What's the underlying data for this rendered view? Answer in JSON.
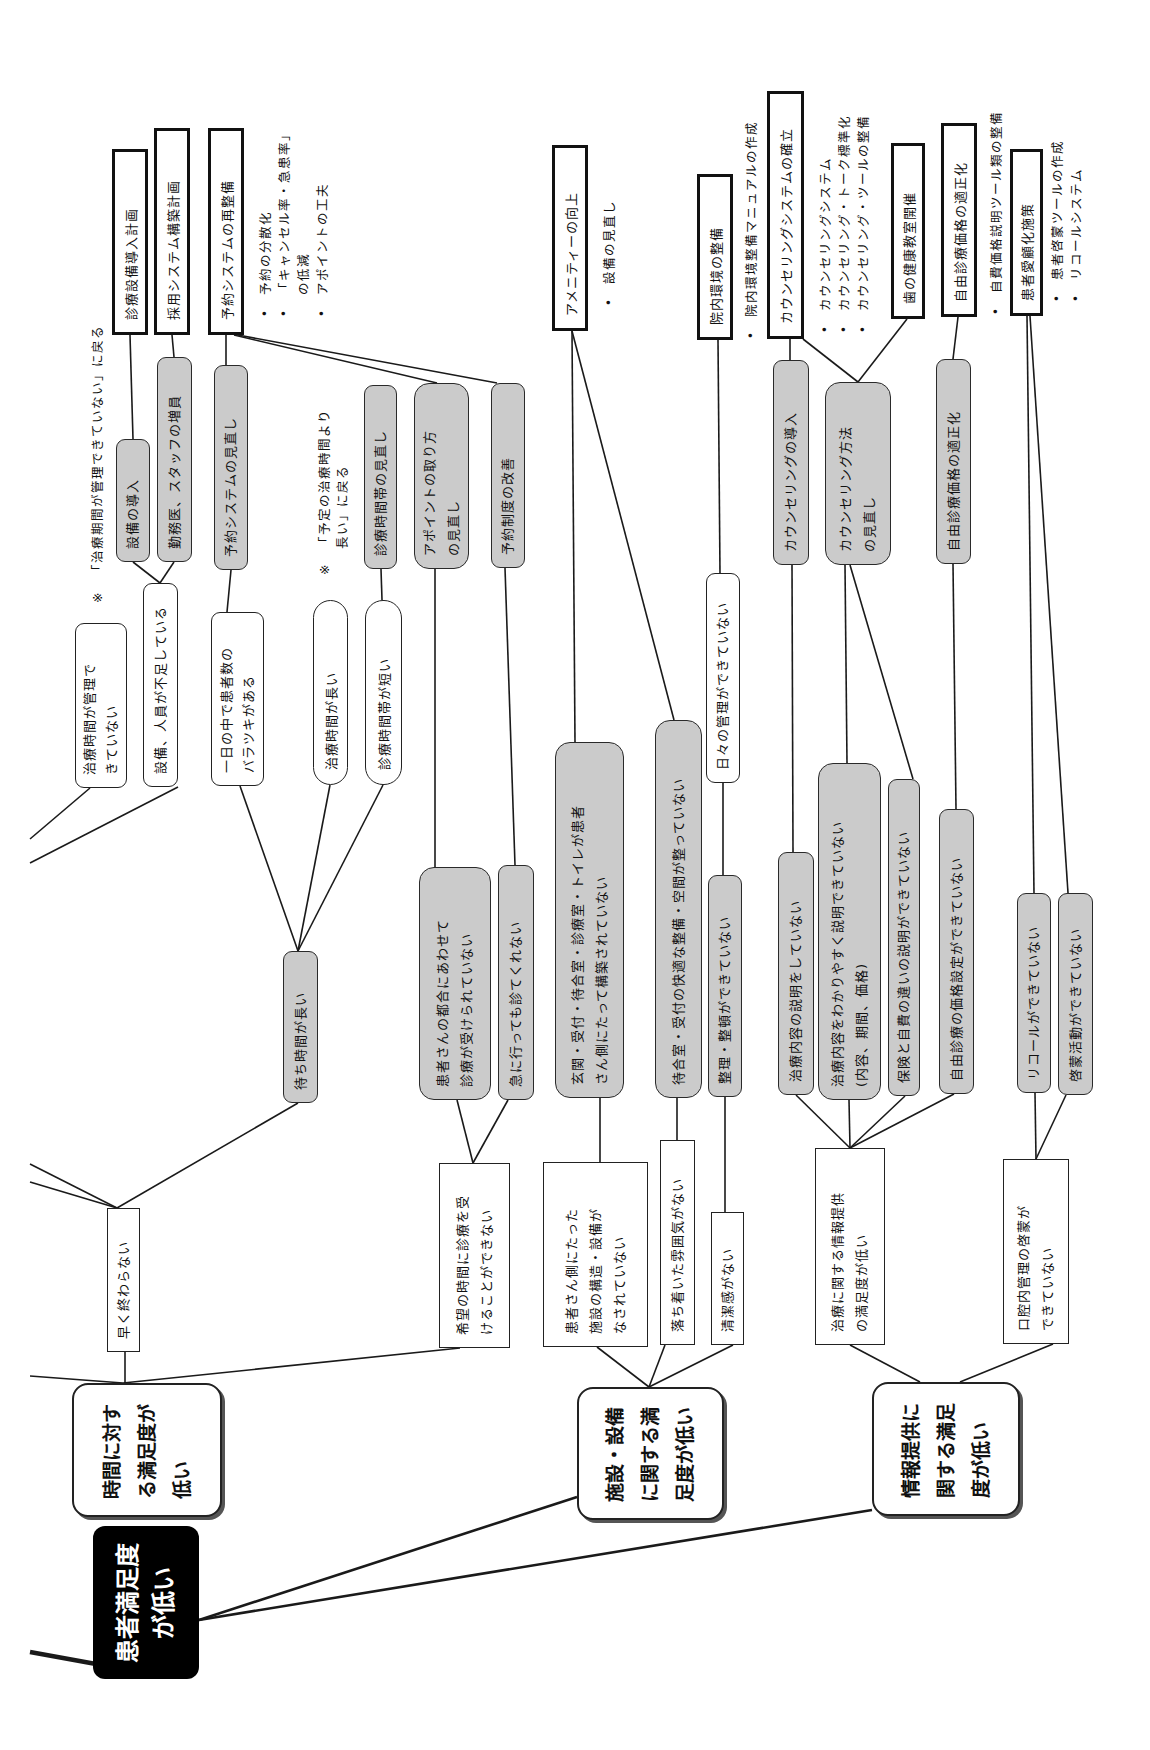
{
  "colors": {
    "solution_fill": "#cbcbcb",
    "root_fill": "#000000",
    "line": "#1a1a1a"
  },
  "root": {
    "label": "患者満足度\nが低い"
  },
  "categories": {
    "time": {
      "label": "時間に対す\nる満足度が\n低い"
    },
    "facility": {
      "label": "施設・設備\nに関する満\n足度が低い"
    },
    "info": {
      "label": "情報提供に\n関する満足\n度が低い"
    }
  },
  "problems": {
    "hayaku": {
      "label": "早く終わらない"
    },
    "kibou": {
      "label": "希望の時間に診療を受\nけることができない"
    },
    "kanjagawa": {
      "label": "患者さん側にたった\n施設の構造・設備が\nなされていない"
    },
    "ochitsuki": {
      "label": "落ち着いた雰囲気がない"
    },
    "seiketsu": {
      "label": "清潔感がない"
    },
    "chiryo_info": {
      "label": "治療に関する情報提供\nの満足度が低い"
    },
    "koukunai": {
      "label": "口腔内管理の啓蒙が\nできていない"
    }
  },
  "issues": {
    "machijikan": {
      "label": "待ち時間が長い"
    },
    "tsugou": {
      "label": "患者さんの都合にあわせて\n診療が受けられていない"
    },
    "kyuu": {
      "label": "急に行っても診てくれない"
    },
    "genkan": {
      "label": "玄関・受付・待合室・診療室・トイレが患者\nさん側にたって構築されていない"
    },
    "machiai": {
      "label": "待合室・受付の快適な整備・空間が整っていない"
    },
    "seiri": {
      "label": "整理・整頓ができていない"
    },
    "setsumei": {
      "label": "治療内容の説明をしていない"
    },
    "wakariyasuku": {
      "label": "治療内容をわかりやすく説明できていない\n(内容、期間、価格)"
    },
    "hoken": {
      "label": "保険と自費の違いの説明ができていない"
    },
    "jiyuu_kakaku": {
      "label": "自由診療の価格設定ができていない"
    },
    "recall": {
      "label": "リコールができていない"
    },
    "keimou": {
      "label": "啓蒙活動ができていない"
    }
  },
  "causes": {
    "chiryo_kanri": {
      "label": "治療時間が管理で\nきていない"
    },
    "setsubi_jinin": {
      "label": "設備、人員が不足している"
    },
    "baratsuki": {
      "label": "一日の中で患者数の\nバラツキがある"
    },
    "chiryo_nagai": {
      "label": "治療時間が長い"
    },
    "shinryo_mijikai": {
      "label": "診療時間帯が短い"
    },
    "hibi": {
      "label": "日々の管理ができていない"
    }
  },
  "solutions": {
    "setsubi_dounyu": {
      "label": "設備の導入"
    },
    "zouin": {
      "label": "勤務医、スタッフの増員"
    },
    "yoyaku_minaoshi": {
      "label": "予約システムの見直し"
    },
    "jikantai": {
      "label": "診療時間帯の見直し"
    },
    "appoint": {
      "label": "アポイントの取り方\nの見直し"
    },
    "yoyaku_seido": {
      "label": "予約制度の改善"
    },
    "counsel_dounyu": {
      "label": "カウンセリングの導入"
    },
    "counsel_houhou": {
      "label": "カウンセリング方法\nの見直し"
    },
    "jiyuu_tekisei": {
      "label": "自由診療価格の適正化"
    }
  },
  "plans": {
    "setsubi": {
      "label": "診療設備導入計画"
    },
    "saiyou": {
      "label": "採用システム構築計画"
    },
    "yoyaku": {
      "label": "予約システムの再整備",
      "bullets": [
        "予約の分散化",
        "「キャンセル率・急患率」\nの低減",
        "アポイントの工夫"
      ]
    },
    "amenity": {
      "label": "アメニティーの向上",
      "bullets": [
        "設備の見直し"
      ]
    },
    "innai": {
      "label": "院内環境の整備",
      "bullets": [
        "院内環境整備マニュアルの作成"
      ]
    },
    "counsel": {
      "label": "カウンセリングシステムの確立",
      "bullets": [
        "カウンセリングシステム",
        "カウンセリング・トーク標準化",
        "カウンセリング・ツールの整備"
      ]
    },
    "ha": {
      "label": "歯の健康教室開催"
    },
    "jiyuu": {
      "label": "自由診療価格の適正化",
      "bullets": [
        "自費価格説明ツール類の整備"
      ]
    },
    "aiko": {
      "label": "患者愛顧化施策",
      "bullets": [
        "患者啓蒙ツールの作成",
        "リコールシステム"
      ]
    }
  },
  "notes": {
    "kikan": {
      "mark": "※",
      "text": "「治療期間が管理できていない」に戻る"
    },
    "yotei": {
      "mark": "※",
      "text": "「予定の治療時間より\n 長い」に戻る"
    }
  },
  "bullet_symbol": "•"
}
